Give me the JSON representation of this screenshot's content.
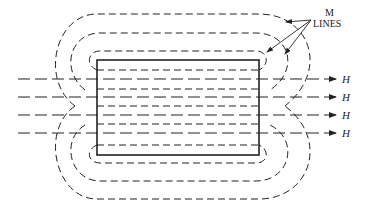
{
  "diagram": {
    "labels": {
      "m_lines_1": "M",
      "m_lines_2": "LINES",
      "h": [
        "H",
        "H",
        "H",
        "H"
      ]
    },
    "colors": {
      "line": "#222222",
      "background": "#ffffff"
    }
  }
}
